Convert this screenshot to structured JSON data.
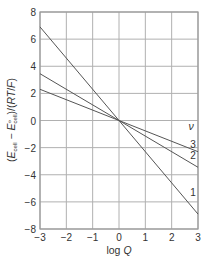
{
  "chart_data": {
    "type": "line",
    "title": "",
    "xlabel": "log Q",
    "ylabel": "(E_cell − E°_cell)/(RT/F)",
    "xlim": [
      -3,
      3
    ],
    "ylim": [
      -8,
      8
    ],
    "xticks": [
      -3,
      -2,
      -1,
      0,
      1,
      2,
      3
    ],
    "yticks": [
      -8,
      -6,
      -4,
      -2,
      0,
      2,
      4,
      6,
      8
    ],
    "grid": true,
    "legend": {
      "title": "ν",
      "position": "right, inline labels at line ends"
    },
    "series": [
      {
        "name": "1",
        "x": [
          -3,
          3
        ],
        "y": [
          6.9,
          -6.9
        ]
      },
      {
        "name": "2",
        "x": [
          -3,
          3
        ],
        "y": [
          3.45,
          -3.45
        ]
      },
      {
        "name": "3",
        "x": [
          -3,
          3
        ],
        "y": [
          2.3,
          -2.3
        ]
      }
    ]
  },
  "labels": {
    "x_axis": {
      "pre": "log ",
      "var": "Q"
    },
    "y_axis": {
      "open": "(",
      "E1": "E",
      "sub1": "cell",
      "minus": " − ",
      "E2": "E",
      "sup2": "⦵",
      "sub2": "cell",
      "rest": ")/(",
      "RT": "RT",
      "slash": "/",
      "F": "F",
      "close": ")"
    },
    "legend_title": "ν",
    "series_labels": [
      "1",
      "2",
      "3"
    ]
  },
  "colors": {
    "grid": "#b0b0b0",
    "frame": "#999999",
    "line": "#555555",
    "text": "#333333"
  }
}
